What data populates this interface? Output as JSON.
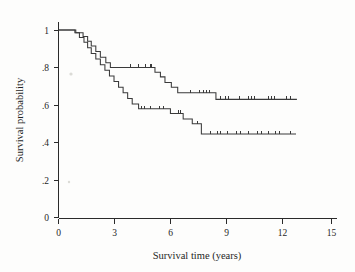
{
  "figure": {
    "background_color": "#fdfdfc",
    "axis_color": "#2a2a2a",
    "curve_color": "#3a3a3a"
  },
  "chart_data": {
    "type": "line",
    "subtype": "kaplan-meier-step",
    "title": "",
    "xlabel": "Survival time (years)",
    "ylabel": "Survival probability",
    "xlim": [
      0,
      15
    ],
    "ylim": [
      0,
      1
    ],
    "xticks": [
      0,
      3,
      6,
      9,
      12,
      15
    ],
    "xticklabels": [
      "0",
      "3",
      "6",
      "9",
      "12",
      "15"
    ],
    "yticks": [
      0,
      0.2,
      0.4,
      0.6,
      0.8,
      1
    ],
    "yticklabels": [
      "0",
      ".2",
      ".4",
      ".6",
      ".8",
      "1"
    ],
    "grid": false,
    "legend": "none",
    "series": [
      {
        "name": "Upper survival curve",
        "final_survival": 0.63,
        "max_time": 13.1,
        "steps": [
          [
            0.0,
            1.0
          ],
          [
            0.85,
            1.0
          ],
          [
            0.95,
            0.985
          ],
          [
            1.25,
            0.985
          ],
          [
            1.35,
            0.965
          ],
          [
            1.5,
            0.965
          ],
          [
            1.6,
            0.94
          ],
          [
            1.72,
            0.94
          ],
          [
            1.8,
            0.915
          ],
          [
            1.95,
            0.915
          ],
          [
            2.05,
            0.885
          ],
          [
            2.2,
            0.885
          ],
          [
            2.3,
            0.855
          ],
          [
            2.5,
            0.855
          ],
          [
            2.6,
            0.825
          ],
          [
            2.75,
            0.825
          ],
          [
            2.85,
            0.8
          ],
          [
            5.2,
            0.8
          ],
          [
            5.3,
            0.775
          ],
          [
            5.5,
            0.775
          ],
          [
            5.6,
            0.75
          ],
          [
            5.75,
            0.75
          ],
          [
            5.85,
            0.72
          ],
          [
            6.1,
            0.72
          ],
          [
            6.2,
            0.695
          ],
          [
            6.45,
            0.695
          ],
          [
            6.55,
            0.665
          ],
          [
            8.55,
            0.665
          ],
          [
            8.65,
            0.63
          ],
          [
            13.1,
            0.63
          ]
        ],
        "censor_times": [
          3.95,
          4.35,
          4.75,
          5.0,
          5.1,
          7.2,
          7.7,
          7.95,
          8.1,
          8.25,
          8.9,
          9.15,
          9.3,
          9.9,
          10.4,
          10.6,
          10.75,
          11.5,
          11.7,
          11.85,
          12.5,
          12.7
        ]
      },
      {
        "name": "Lower survival curve",
        "final_survival": 0.445,
        "max_time": 13.05,
        "steps": [
          [
            0.0,
            1.0
          ],
          [
            0.8,
            1.0
          ],
          [
            0.9,
            0.985
          ],
          [
            1.05,
            0.985
          ],
          [
            1.15,
            0.96
          ],
          [
            1.3,
            0.96
          ],
          [
            1.4,
            0.935
          ],
          [
            1.5,
            0.935
          ],
          [
            1.6,
            0.905
          ],
          [
            1.7,
            0.905
          ],
          [
            1.8,
            0.875
          ],
          [
            1.95,
            0.875
          ],
          [
            2.05,
            0.845
          ],
          [
            2.2,
            0.845
          ],
          [
            2.3,
            0.815
          ],
          [
            2.45,
            0.815
          ],
          [
            2.55,
            0.785
          ],
          [
            2.7,
            0.785
          ],
          [
            2.8,
            0.755
          ],
          [
            2.95,
            0.755
          ],
          [
            3.05,
            0.725
          ],
          [
            3.2,
            0.725
          ],
          [
            3.3,
            0.695
          ],
          [
            3.45,
            0.695
          ],
          [
            3.55,
            0.665
          ],
          [
            3.7,
            0.665
          ],
          [
            3.8,
            0.635
          ],
          [
            3.95,
            0.635
          ],
          [
            4.05,
            0.605
          ],
          [
            4.3,
            0.605
          ],
          [
            4.4,
            0.58
          ],
          [
            6.05,
            0.58
          ],
          [
            6.15,
            0.555
          ],
          [
            6.75,
            0.555
          ],
          [
            6.85,
            0.525
          ],
          [
            7.25,
            0.525
          ],
          [
            7.35,
            0.5
          ],
          [
            7.75,
            0.5
          ],
          [
            7.85,
            0.445
          ],
          [
            13.05,
            0.445
          ]
        ],
        "censor_times": [
          4.55,
          4.7,
          5.0,
          5.5,
          5.75,
          6.55,
          6.65,
          7.6,
          8.35,
          8.7,
          8.85,
          9.25,
          9.75,
          9.95,
          10.4,
          10.9,
          11.1,
          11.5,
          11.9,
          12.1,
          12.7
        ]
      }
    ]
  }
}
